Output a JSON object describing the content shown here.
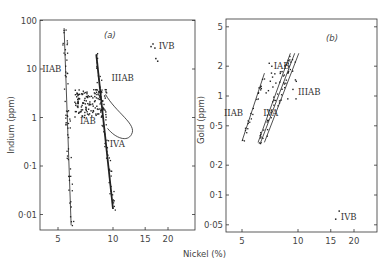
{
  "figure": {
    "xlabel": "Nickel (%)",
    "background": "#ffffff",
    "ink": "#222222"
  },
  "chart_data": [
    {
      "type": "scatter",
      "panel_label": "(a)",
      "title": "",
      "xlabel": "Nickel (%)",
      "ylabel": "Indium (ppm)",
      "xscale": "log",
      "yscale": "log",
      "xlim": [
        4,
        25
      ],
      "ylim": [
        0.004,
        100
      ],
      "xticks": [
        5,
        10,
        15,
        20
      ],
      "xtick_labels": [
        "5",
        "10",
        "15",
        "20"
      ],
      "yticks": [
        100,
        10,
        1,
        0.1,
        0.01
      ],
      "ytick_labels": [
        "100",
        "10",
        "1",
        "0·1",
        "0·01"
      ],
      "grid": false,
      "groups": [
        {
          "name": "IIAB",
          "label": "IIAB",
          "label_pos": [
            4.1,
            10
          ],
          "trend": [
            [
              5.4,
              70
            ],
            [
              5.9,
              0.006
            ]
          ],
          "trend_width": 0.8
        },
        {
          "name": "IIIAB",
          "label": "IIIAB",
          "label_pos": [
            9.8,
            6.5
          ],
          "trend": [
            [
              8.1,
              20
            ],
            [
              10.0,
              0.013
            ]
          ],
          "trend_width": 1.8
        },
        {
          "name": "IAB",
          "label": "IAB",
          "label_pos": [
            6.6,
            0.85
          ],
          "cluster_center": [
            7.5,
            2.0
          ]
        },
        {
          "name": "IVA",
          "label": "IVA",
          "label_pos": [
            9.6,
            0.28
          ],
          "note": "enclosed by loop"
        },
        {
          "name": "IVB",
          "label": "IVB",
          "label_pos": [
            17.8,
            30
          ],
          "points": [
            [
              16.0,
              30
            ],
            [
              16.4,
              34
            ],
            [
              16.8,
              28
            ],
            [
              17.0,
              17
            ],
            [
              17.4,
              15
            ]
          ]
        }
      ]
    },
    {
      "type": "scatter",
      "panel_label": "(b)",
      "title": "",
      "xlabel": "Nickel (%)",
      "ylabel": "Gold (ppm)",
      "xscale": "log",
      "yscale": "log",
      "xlim": [
        4,
        25
      ],
      "ylim": [
        0.04,
        6
      ],
      "xticks": [
        5,
        10,
        15,
        20
      ],
      "xtick_labels": [
        "5",
        "10",
        "15",
        "20"
      ],
      "yticks": [
        5,
        2,
        1,
        0.5,
        0.2,
        0.1,
        0.05
      ],
      "ytick_labels": [
        "5",
        "2",
        "1",
        "0·5",
        "0·2",
        "0·1",
        "0·05"
      ],
      "grid": false,
      "groups": [
        {
          "name": "IIAB",
          "label": "IIAB",
          "label_pos": [
            4.0,
            0.68
          ],
          "trend": [
            [
              5.0,
              0.35
            ],
            [
              6.6,
              1.7
            ]
          ]
        },
        {
          "name": "IAB",
          "label": "IAB",
          "label_pos": [
            7.4,
            2.0
          ],
          "cluster_center": [
            8.0,
            1.4
          ]
        },
        {
          "name": "IIIAB",
          "label": "IIIAB",
          "label_pos": [
            10.0,
            1.1
          ],
          "trend_pair": [
            [
              [
                6.3,
                0.34
              ],
              [
                9.6,
                2.7
              ]
            ],
            [
              [
                6.6,
                0.34
              ],
              [
                10.1,
                2.7
              ]
            ]
          ]
        },
        {
          "name": "IVA",
          "label": "IVA",
          "label_pos": [
            6.5,
            0.68
          ],
          "trend": [
            [
              6.1,
              0.34
            ],
            [
              9.1,
              2.7
            ]
          ]
        },
        {
          "name": "IVB",
          "label": "IVB",
          "label_pos": [
            17.0,
            0.06
          ],
          "points": [
            [
              15.8,
              0.058
            ],
            [
              16.5,
              0.07
            ]
          ]
        }
      ]
    }
  ]
}
